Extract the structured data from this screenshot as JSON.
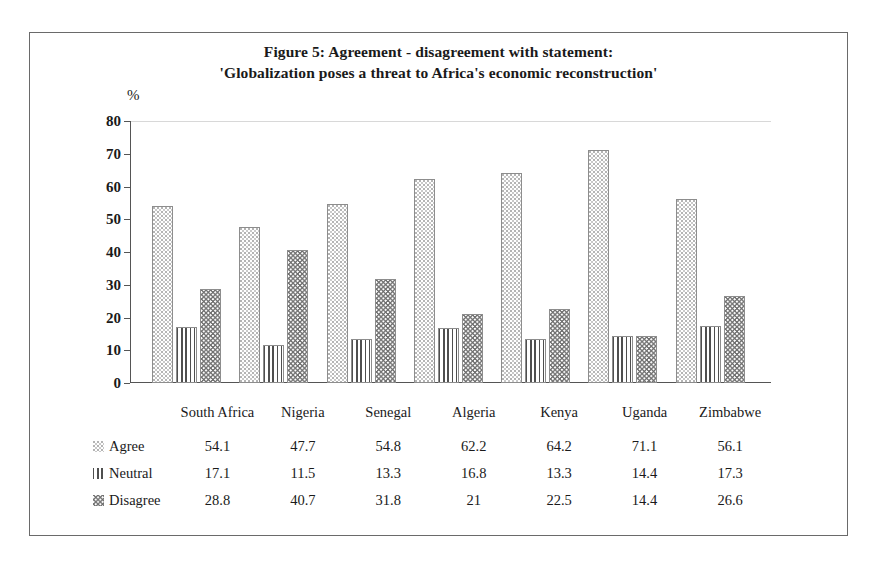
{
  "figure": {
    "title_line_1": "Figure 5: Agreement - disagreement with statement:",
    "title_line_2": "'Globalization poses a threat to Africa's economic reconstruction'",
    "axis_unit_label": "%"
  },
  "chart_data": {
    "type": "bar",
    "title": "Figure 5: Agreement - disagreement with statement: 'Globalization poses a threat to Africa's economic reconstruction'",
    "xlabel": "",
    "ylabel": "%",
    "ylim": [
      0,
      80
    ],
    "yticks": [
      "0",
      "10",
      "20",
      "30",
      "40",
      "50",
      "60",
      "70",
      "80"
    ],
    "ytick_values": [
      0,
      10,
      20,
      30,
      40,
      50,
      60,
      70,
      80
    ],
    "grid": false,
    "legend_position": "table-row-labels",
    "categories": [
      "South Africa",
      "Nigeria",
      "Senegal",
      "Algeria",
      "Kenya",
      "Uganda",
      "Zimbabwe"
    ],
    "series": [
      {
        "name": "Agree",
        "pattern": "dotted-checker",
        "values": [
          54.1,
          47.7,
          54.8,
          62.2,
          64.2,
          71.1,
          56.1
        ]
      },
      {
        "name": "Neutral",
        "pattern": "vertical-lines",
        "values": [
          17.1,
          11.5,
          13.3,
          16.8,
          13.3,
          14.4,
          17.3
        ]
      },
      {
        "name": "Disagree",
        "pattern": "zigzag-waves",
        "values": [
          28.8,
          40.7,
          31.8,
          21,
          22.5,
          14.4,
          26.6
        ]
      }
    ],
    "value_labels": [
      [
        "54.1",
        "47.7",
        "54.8",
        "62.2",
        "64.2",
        "71.1",
        "56.1"
      ],
      [
        "17.1",
        "11.5",
        "13.3",
        "16.8",
        "13.3",
        "14.4",
        "17.3"
      ],
      [
        "28.8",
        "40.7",
        "31.8",
        "21",
        "22.5",
        "14.4",
        "26.6"
      ]
    ]
  },
  "table": {
    "header_blank": "",
    "countries": [
      "South Africa",
      "Nigeria",
      "Senegal",
      "Algeria",
      "Kenya",
      "Uganda",
      "Zimbabwe"
    ],
    "rows": [
      {
        "label": "Agree",
        "values": [
          "54.1",
          "47.7",
          "54.8",
          "62.2",
          "64.2",
          "71.1",
          "56.1"
        ]
      },
      {
        "label": "Neutral",
        "values": [
          "17.1",
          "11.5",
          "13.3",
          "16.8",
          "13.3",
          "14.4",
          "17.3"
        ]
      },
      {
        "label": "Disagree",
        "values": [
          "28.8",
          "40.7",
          "31.8",
          "21",
          "22.5",
          "14.4",
          "26.6"
        ]
      }
    ]
  },
  "colors": {
    "frame": "#6a6a6a",
    "axis": "#555555",
    "grid": "#d8d8d8",
    "text": "#1a1a1a",
    "table_border": "#8a8a8a"
  }
}
